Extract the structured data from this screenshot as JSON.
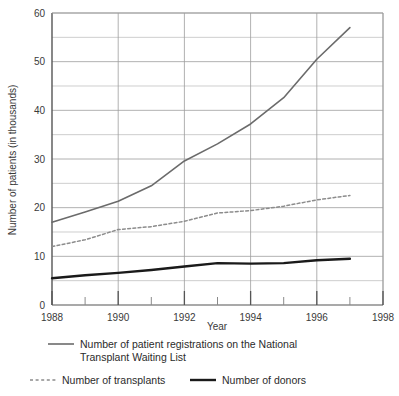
{
  "chart_data": {
    "type": "line",
    "title": "",
    "xlabel": "Year",
    "ylabel": "Number of patients (in thousands)",
    "xlim": [
      1988,
      1998
    ],
    "ylim": [
      0,
      60
    ],
    "grid": true,
    "y_major_step": 10,
    "y_minor_step": 5,
    "x_tick_step": 1,
    "x_label_step": 2,
    "xticklabels": [
      "1988",
      "1990",
      "1992",
      "1994",
      "1996",
      "1998"
    ],
    "xticklabel_values": [
      1988,
      1990,
      1992,
      1994,
      1996,
      1998
    ],
    "yticklabels": [
      "0",
      "10",
      "20",
      "30",
      "40",
      "50",
      "60"
    ],
    "yticklabel_values": [
      0,
      10,
      20,
      30,
      40,
      50,
      60
    ],
    "x": [
      1988,
      1989,
      1990,
      1991,
      1992,
      1993,
      1994,
      1995,
      1996,
      1997
    ],
    "legend_position": "below-plot",
    "series": [
      {
        "name": "Number of patient registrations on the National Transplant Waiting List",
        "style": "solid",
        "color": "#6b6b6b",
        "width": 1.6,
        "values": [
          17.0,
          19.1,
          21.3,
          24.5,
          29.6,
          33.1,
          37.2,
          42.6,
          50.5,
          57.0
        ]
      },
      {
        "name": "Number of transplants",
        "style": "dashed",
        "color": "#8c8c8c",
        "width": 1.5,
        "values": [
          12.0,
          13.4,
          15.5,
          16.1,
          17.2,
          18.9,
          19.4,
          20.3,
          21.6,
          22.5
        ]
      },
      {
        "name": "Number of donors",
        "style": "solid",
        "color": "#1a1a1a",
        "width": 2.4,
        "values": [
          5.5,
          6.1,
          6.6,
          7.2,
          7.9,
          8.6,
          8.5,
          8.6,
          9.2,
          9.5
        ]
      }
    ]
  },
  "legend": {
    "entries": [
      {
        "key": "registrations",
        "swatch": "solid-gray",
        "line1": "Number of patient registrations on the National",
        "line2": "Transplant Waiting List"
      },
      {
        "key": "transplants",
        "swatch": "dashed-gray",
        "line1": "Number of transplants",
        "line2": ""
      },
      {
        "key": "donors",
        "swatch": "solid-black",
        "line1": "Number of donors",
        "line2": ""
      }
    ]
  },
  "colors": {
    "registrations": "#6b6b6b",
    "transplants": "#8c8c8c",
    "donors": "#1a1a1a",
    "axis": "#555555",
    "grid": "#b9b9b9",
    "text": "#2b2b2b",
    "background": "#ffffff"
  }
}
